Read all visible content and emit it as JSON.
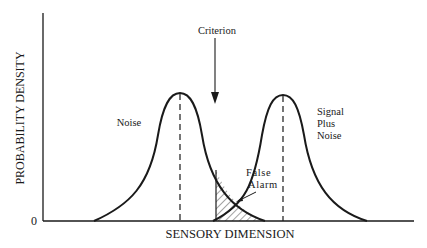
{
  "diagram": {
    "type": "signal-detection-theory",
    "y_axis_label": "PROBABILITY DENSITY",
    "x_axis_label": "SENSORY DIMENSION",
    "origin_label": "0",
    "criterion_label": "Criterion",
    "noise_label": "Noise",
    "signal_label_line1": "Signal",
    "signal_label_line2": "Plus",
    "signal_label_line3": "Noise",
    "false_alarm_line1": "False",
    "false_alarm_line2": "Alarm",
    "colors": {
      "ink": "#1a1a1a",
      "background": "#ffffff"
    }
  }
}
